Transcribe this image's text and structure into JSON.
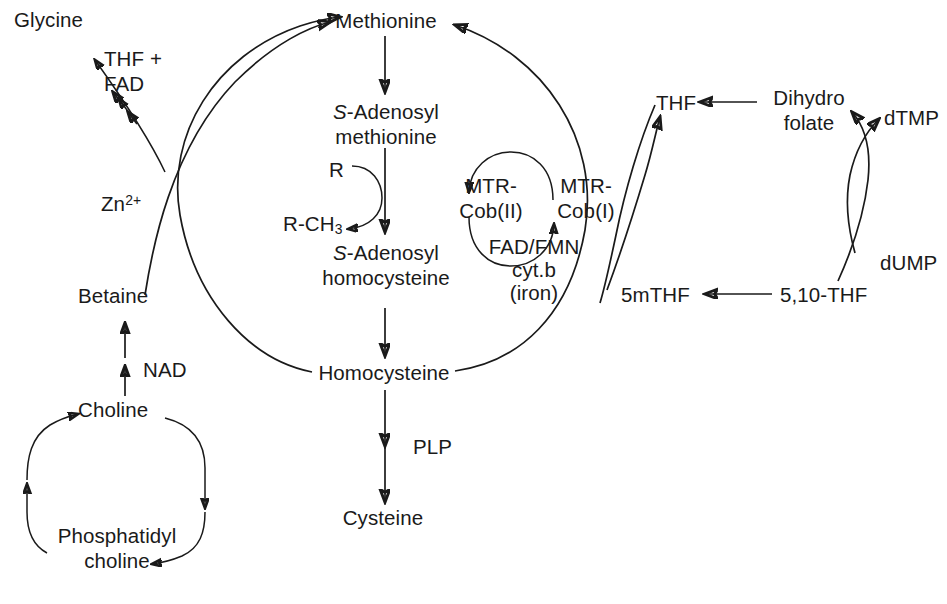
{
  "diagram": {
    "type": "biochemical-pathway",
    "background_color": "#ffffff",
    "stroke_color": "#1a1a1a"
  },
  "nodes": {
    "glycine": "Glycine",
    "thf_fad": {
      "line1": "THF +",
      "line2": "FAD"
    },
    "zinc": {
      "base": "Zn",
      "sup": "2+"
    },
    "betaine": "Betaine",
    "nad": "NAD",
    "choline": "Choline",
    "phosphatidyl_choline": {
      "line1": "Phosphatidyl",
      "line2": "choline"
    },
    "methionine": "Methionine",
    "sam": {
      "line1": "S-Adenosyl",
      "line2": "methionine",
      "italic_prefix": "S"
    },
    "r": "R",
    "r_ch3": {
      "base": "R-CH",
      "sub": "3"
    },
    "sah": {
      "line1": "S-Adenosyl",
      "line2": "homocysteine",
      "italic_prefix": "S"
    },
    "homocysteine": "Homocysteine",
    "plp": "PLP",
    "cysteine": "Cysteine",
    "mtr_cob2": {
      "line1": "MTR-",
      "line2": "Cob(II)"
    },
    "mtr_cob1": {
      "line1": "MTR-",
      "line2": "Cob(I)"
    },
    "cofactors": {
      "line1": "FAD/FMN",
      "line2": "cyt.b",
      "line3": "(iron)"
    },
    "thf": "THF",
    "dihydrofolate": {
      "line1": "Dihydro",
      "line2": "folate"
    },
    "dtmp": "dTMP",
    "five_m_thf": "5mTHF",
    "five_ten_thf": "5,10-THF",
    "dump": "dUMP"
  },
  "edges": [
    {
      "from": "betaine",
      "to": "glycine",
      "cofactor": "THF + FAD",
      "style": "double-arrow"
    },
    {
      "from": "choline",
      "to": "betaine",
      "cofactor": "NAD",
      "style": "double-arrow"
    },
    {
      "from": "choline",
      "to": "phosphatidyl_choline",
      "style": "curve"
    },
    {
      "from": "phosphatidyl_choline",
      "to": "choline",
      "style": "curve"
    },
    {
      "from": "betaine",
      "to": "methionine",
      "cofactor": "Zn2+",
      "style": "curve"
    },
    {
      "from": "homocysteine",
      "to": "methionine",
      "style": "ellipse-left"
    },
    {
      "from": "homocysteine",
      "to": "methionine",
      "style": "ellipse-right"
    },
    {
      "from": "methionine",
      "to": "sam",
      "style": "straight"
    },
    {
      "from": "sam",
      "to": "sah",
      "style": "straight"
    },
    {
      "from": "r",
      "to": "r_ch3",
      "style": "curve-transfer"
    },
    {
      "from": "sah",
      "to": "homocysteine",
      "style": "straight"
    },
    {
      "from": "homocysteine",
      "to": "cysteine",
      "cofactor": "PLP",
      "style": "straight"
    },
    {
      "from": "mtr_cob1",
      "to": "mtr_cob2",
      "style": "arc-top"
    },
    {
      "from": "mtr_cob2",
      "to": "mtr_cob1",
      "style": "arc-bottom"
    },
    {
      "from": "five_m_thf",
      "to": "thf",
      "style": "curve-cross"
    },
    {
      "from": "thf",
      "to": "five_m_thf",
      "style": "curve-cross"
    },
    {
      "from": "dihydrofolate",
      "to": "thf",
      "style": "straight-arrow"
    },
    {
      "from": "five_ten_thf",
      "to": "five_m_thf",
      "style": "straight-arrow"
    },
    {
      "from": "five_ten_thf",
      "to": "dihydrofolate",
      "style": "curve-cross"
    },
    {
      "from": "dump",
      "to": "dtmp",
      "style": "curve-cross"
    }
  ]
}
